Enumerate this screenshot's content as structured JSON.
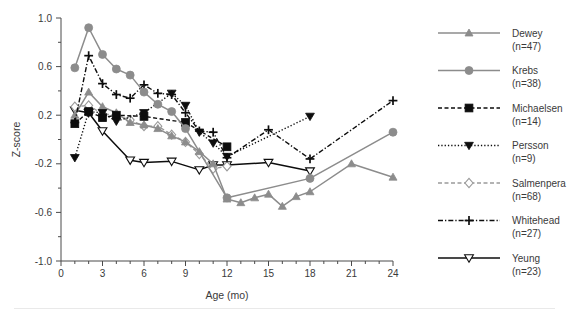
{
  "chart_data": {
    "type": "line",
    "title": "",
    "xlabel": "Age (mo)",
    "ylabel": "Z-score",
    "xlim": [
      0,
      24
    ],
    "ylim": [
      -1.0,
      1.0
    ],
    "grid": false,
    "legend_position": "right",
    "x_ticks": [
      0,
      3,
      6,
      9,
      12,
      15,
      18,
      21,
      24
    ],
    "x_tick_labels": [
      "0",
      "3",
      "6",
      "9",
      "12",
      "15",
      "18",
      "21",
      "24"
    ],
    "x_minor_step": 1,
    "y_ticks": [
      -1.0,
      -0.6,
      -0.2,
      0.2,
      0.6,
      1.0
    ],
    "y_tick_labels": [
      "-1.0",
      "-0.6",
      "-0.2",
      "0.2",
      "0.6",
      "1.0"
    ],
    "y_minor_step": 0.2,
    "series": [
      {
        "name": "Dewey",
        "label": "Dewey",
        "n_label": "(n=47)",
        "n": 47,
        "color": "#8c8c8c",
        "marker": "triangle-up-filled",
        "line_style": "solid",
        "x": [
          1,
          2,
          3,
          4,
          5,
          6,
          7,
          8,
          9,
          10,
          11,
          12,
          13,
          14,
          15,
          16,
          17,
          18,
          21,
          24
        ],
        "y": [
          0.2,
          0.39,
          0.27,
          0.22,
          0.14,
          0.12,
          0.09,
          0.03,
          -0.02,
          -0.1,
          -0.2,
          -0.49,
          -0.52,
          -0.48,
          -0.45,
          -0.55,
          -0.47,
          -0.43,
          -0.2,
          -0.31
        ]
      },
      {
        "name": "Krebs",
        "label": "Krebs",
        "n_label": "(n=38)",
        "n": 38,
        "color": "#8c8c8c",
        "marker": "circle-filled",
        "line_style": "solid",
        "x": [
          1,
          2,
          3,
          4,
          5,
          6,
          7,
          8,
          9,
          12,
          18,
          24
        ],
        "y": [
          0.59,
          0.92,
          0.7,
          0.58,
          0.53,
          0.39,
          0.29,
          0.23,
          0.09,
          -0.48,
          -0.32,
          0.06
        ]
      },
      {
        "name": "Michaelsen",
        "label": "Michaelsen",
        "n_label": "(n=14)",
        "n": 14,
        "color": "#0d0d0d",
        "marker": "square-filled",
        "line_style": "dashed",
        "x": [
          1,
          2,
          3,
          4,
          6,
          9,
          12
        ],
        "y": [
          0.13,
          0.23,
          0.18,
          0.2,
          0.19,
          0.14,
          -0.06
        ]
      },
      {
        "name": "Persson",
        "label": "Persson",
        "n_label": "(n=9)",
        "n": 9,
        "color": "#0d0d0d",
        "marker": "triangle-down-filled",
        "line_style": "dotted",
        "x": [
          1,
          2,
          3,
          4,
          6,
          8,
          9,
          10,
          11,
          12,
          18
        ],
        "y": [
          -0.15,
          0.23,
          0.22,
          0.15,
          0.22,
          0.38,
          0.28,
          0.06,
          -0.03,
          -0.14,
          0.19
        ]
      },
      {
        "name": "Salmenpera",
        "label": "Salmenpera",
        "n_label": "(n=68)",
        "n": 68,
        "color": "#9a9a9a",
        "marker": "diamond-open",
        "line_style": "dashed",
        "x": [
          1,
          2,
          3,
          4,
          5,
          6,
          7,
          8,
          9,
          10,
          11,
          12
        ],
        "y": [
          0.27,
          0.28,
          0.21,
          0.2,
          0.16,
          0.11,
          0.11,
          0.04,
          -0.02,
          -0.12,
          -0.24,
          -0.22
        ]
      },
      {
        "name": "Whitehead",
        "label": "Whitehead",
        "n_label": "(n=27)",
        "n": 27,
        "color": "#0d0d0d",
        "marker": "plus",
        "line_style": "dashdot",
        "x": [
          1,
          2,
          3,
          4,
          5,
          6,
          7,
          8,
          9,
          10,
          11,
          12,
          15,
          18,
          24
        ],
        "y": [
          0.14,
          0.69,
          0.46,
          0.37,
          0.34,
          0.45,
          0.38,
          0.37,
          0.22,
          0.07,
          0.06,
          -0.15,
          0.08,
          -0.16,
          0.32
        ]
      },
      {
        "name": "Yeung",
        "label": "Yeung",
        "n_label": "(n=23)",
        "n": 23,
        "color": "#0d0d0d",
        "marker": "triangle-down-open",
        "line_style": "solid",
        "x": [
          1,
          2,
          3,
          5,
          6,
          8,
          10,
          11,
          12,
          15,
          18
        ],
        "y": [
          0.24,
          0.22,
          0.07,
          -0.17,
          -0.19,
          -0.18,
          -0.25,
          -0.21,
          -0.21,
          -0.19,
          -0.26
        ]
      }
    ]
  },
  "axes": {
    "x_title": "Age (mo)",
    "y_title": "Z-score"
  }
}
